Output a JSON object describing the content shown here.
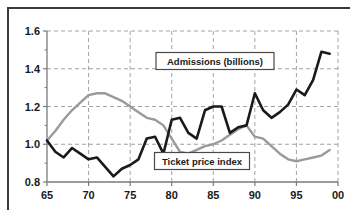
{
  "chart_data": {
    "type": "line",
    "title": "",
    "xlabel": "",
    "ylabel": "",
    "grid": true,
    "legend_position": "inside-plot",
    "xlim": [
      65,
      100
    ],
    "ylim": [
      0.8,
      1.6
    ],
    "x_tick_labels": [
      "65",
      "70",
      "75",
      "80",
      "85",
      "90",
      "95",
      "00"
    ],
    "x_tick_values": [
      65,
      70,
      75,
      80,
      85,
      90,
      95,
      100
    ],
    "y_tick_labels": [
      "0.8",
      "1.0",
      "1.2",
      "1.4",
      "1.6"
    ],
    "y_tick_values": [
      0.8,
      1.0,
      1.2,
      1.4,
      1.6
    ],
    "x": [
      65,
      66,
      67,
      68,
      69,
      70,
      71,
      72,
      73,
      74,
      75,
      76,
      77,
      78,
      79,
      80,
      81,
      82,
      83,
      84,
      85,
      86,
      87,
      88,
      89,
      90,
      91,
      92,
      93,
      94,
      95,
      96,
      97,
      98,
      99
    ],
    "series": [
      {
        "name": "Admissions (billions)",
        "color": "#1a1a1a",
        "values": [
          1.02,
          0.96,
          0.93,
          0.98,
          0.95,
          0.92,
          0.93,
          0.88,
          0.83,
          0.87,
          0.89,
          0.92,
          1.03,
          1.04,
          0.95,
          1.13,
          1.14,
          1.06,
          1.03,
          1.18,
          1.2,
          1.2,
          1.06,
          1.09,
          1.1,
          1.27,
          1.18,
          1.14,
          1.17,
          1.21,
          1.29,
          1.26,
          1.34,
          1.49,
          1.48
        ]
      },
      {
        "name": "Ticket price index",
        "color": "#9a9a9a",
        "values": [
          1.02,
          1.07,
          1.13,
          1.18,
          1.22,
          1.26,
          1.27,
          1.27,
          1.25,
          1.23,
          1.2,
          1.17,
          1.14,
          1.13,
          1.1,
          1.03,
          0.96,
          0.95,
          0.97,
          0.99,
          1.0,
          1.02,
          1.05,
          1.08,
          1.1,
          1.04,
          1.03,
          0.99,
          0.95,
          0.92,
          0.91,
          0.92,
          0.93,
          0.94,
          0.97
        ]
      }
    ],
    "annotations": [
      {
        "name": "admissions-label",
        "text": "Admissions (billions)"
      },
      {
        "name": "ticket-price-label",
        "text": "Ticket price index"
      }
    ],
    "colors": {
      "admissions": "#1a1a1a",
      "ticket_price": "#9a9a9a",
      "grid": "#8a8a8a",
      "axis": "#7a7a7a",
      "border": "#3a3a3a",
      "background": "#ffffff"
    }
  }
}
